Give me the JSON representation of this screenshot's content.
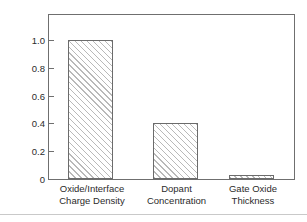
{
  "chart_data": {
    "type": "bar",
    "title": "",
    "xlabel": "",
    "ylabel": "Relative Variance",
    "categories": [
      "Oxide/Interface Charge Density",
      "Dopant Concentration",
      "Gate Oxide Thickness"
    ],
    "category_lines": [
      [
        "Oxide/Interface",
        "Charge Density"
      ],
      [
        "Dopant",
        "Concentration"
      ],
      [
        "Gate Oxide",
        "Thickness"
      ]
    ],
    "values": [
      1.0,
      0.4,
      0.03
    ],
    "ylim": [
      0,
      1.18
    ],
    "yticks": [
      0,
      0.2,
      0.4,
      0.6,
      0.8,
      1.0
    ],
    "ytick_labels": [
      "0",
      "0.2",
      "0.4",
      "0.6",
      "0.8",
      "1.0"
    ],
    "grid": false,
    "legend": false,
    "bar_fill": "hatched-diagonal",
    "colors": {
      "bar_edge": "#6b6b6b",
      "bar_hatch": "#b9b9b9",
      "frame": "#6f6f6f",
      "text": "#2b2b2b",
      "background": "#ffffff",
      "bottom_rule": "#c9c9c9"
    }
  }
}
